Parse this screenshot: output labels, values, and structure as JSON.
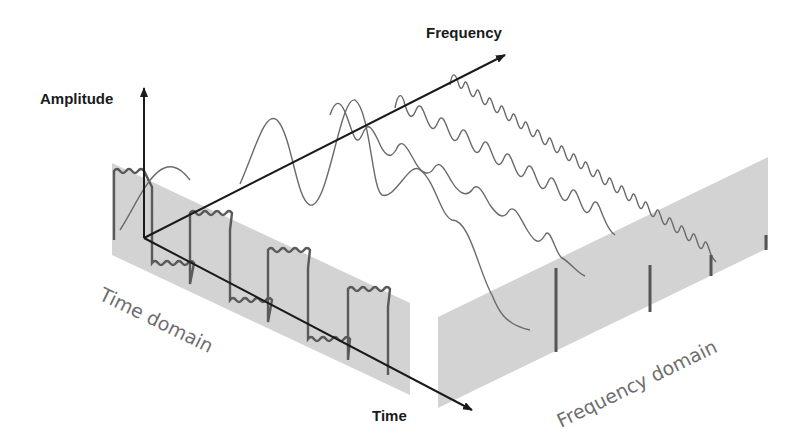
{
  "labels": {
    "amplitude_axis": "Amplitude",
    "frequency_axis": "Frequency",
    "time_axis": "Time",
    "time_domain": "Time domain",
    "frequency_domain": "Frequency domain"
  },
  "colors": {
    "panel_fill": "#d3d3d3",
    "axis": "#1a1a1a",
    "wave": "#6a6a6a",
    "bar": "#555555"
  },
  "components": {
    "count": 4,
    "relative_frequencies": [
      1,
      3,
      5,
      7
    ],
    "spectral_line_heights": [
      "large",
      "medium",
      "small",
      "smallest"
    ]
  }
}
